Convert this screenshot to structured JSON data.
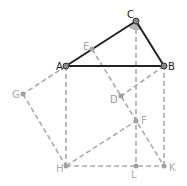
{
  "diagram": {
    "points": {
      "A": {
        "label": "A",
        "x": 66,
        "y": 66,
        "color": "#333333",
        "label_color": "#222222"
      },
      "B": {
        "label": "B",
        "x": 164,
        "y": 66,
        "color": "#333333",
        "label_color": "#222222"
      },
      "C": {
        "label": "C",
        "x": 136,
        "y": 21,
        "color": "#333333",
        "label_color": "#222222"
      },
      "E": {
        "label": "E",
        "x": 92,
        "y": 49,
        "color": "#999999",
        "label_color": "#aaaaaa"
      },
      "D": {
        "label": "D",
        "x": 121,
        "y": 96,
        "color": "#999999",
        "label_color": "#999999"
      },
      "F": {
        "label": "F",
        "x": 136,
        "y": 121,
        "color": "#999999",
        "label_color": "#aaaaaa"
      },
      "G": {
        "label": "G",
        "x": 23,
        "y": 94,
        "color": "#999999",
        "label_color": "#aaaaaa"
      },
      "H": {
        "label": "H",
        "x": 66,
        "y": 166,
        "color": "#999999",
        "label_color": "#aaaaaa"
      },
      "L": {
        "label": "L",
        "x": 136,
        "y": 166,
        "color": "#999999",
        "label_color": "#aaaaaa"
      },
      "K": {
        "label": "K",
        "x": 164,
        "y": 166,
        "color": "#999999",
        "label_color": "#aaaaaa"
      }
    },
    "solid_segments": [
      [
        "A",
        "B"
      ],
      [
        "B",
        "C"
      ],
      [
        "C",
        "A"
      ]
    ],
    "dashed_segments": [
      [
        "A",
        "H"
      ],
      [
        "H",
        "K"
      ],
      [
        "K",
        "B"
      ],
      [
        "C",
        "L"
      ],
      [
        "A",
        "G"
      ],
      [
        "G",
        "H"
      ],
      [
        "H",
        "F"
      ],
      [
        "E",
        "K"
      ],
      [
        "B",
        "D"
      ]
    ],
    "angle_marker": {
      "at": "C",
      "color": "#aaaaaa"
    },
    "colors": {
      "solid": "#222222",
      "dashed": "#aaaaaa"
    }
  }
}
